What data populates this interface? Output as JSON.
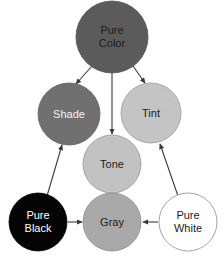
{
  "diagram": {
    "background_color": "#ffffff",
    "arrow_color": "#3a3a3a",
    "nodes": [
      {
        "id": "pure-color",
        "label_line1": "Pure",
        "label_line2": "Color",
        "cx": 112,
        "cy": 37,
        "r": 36,
        "fill": "#5b5b5b",
        "stroke": "#4f4f4f",
        "text_color": "#1c1c1c",
        "two_line": true
      },
      {
        "id": "shade",
        "label_line1": "Shade",
        "label_line2": "",
        "cx": 69,
        "cy": 114,
        "r": 31,
        "fill": "#707070",
        "stroke": "#636363",
        "text_color": "#f2f2f2",
        "two_line": false
      },
      {
        "id": "tint",
        "label_line1": "Tint",
        "label_line2": "",
        "cx": 151,
        "cy": 113,
        "r": 30,
        "fill": "#c4c4c4",
        "stroke": "#9a9a9a",
        "text_color": "#1c1c1c",
        "two_line": false
      },
      {
        "id": "tone",
        "label_line1": "Tone",
        "label_line2": "",
        "cx": 112,
        "cy": 164,
        "r": 29,
        "fill": "#c2c2c2",
        "stroke": "#979797",
        "text_color": "#1c1c1c",
        "two_line": false
      },
      {
        "id": "pure-black",
        "label_line1": "Pure",
        "label_line2": "Black",
        "cx": 38,
        "cy": 222,
        "r": 29,
        "fill": "#050505",
        "stroke": "#050505",
        "text_color": "#ffffff",
        "two_line": true
      },
      {
        "id": "gray",
        "label_line1": "Gray",
        "label_line2": "",
        "cx": 112,
        "cy": 222,
        "r": 29,
        "fill": "#a9a9a9",
        "stroke": "#8a8a8a",
        "text_color": "#1c1c1c",
        "two_line": false
      },
      {
        "id": "pure-white",
        "label_line1": "Pure",
        "label_line2": "White",
        "cx": 188,
        "cy": 222,
        "r": 29,
        "fill": "#ffffff",
        "stroke": "#8d8d8d",
        "text_color": "#1c1c1c",
        "two_line": true
      }
    ],
    "edges": [
      {
        "id": "pure-color-to-shade",
        "from": "pure-color",
        "to": "shade",
        "x1": 92,
        "y1": 66,
        "x2": 76,
        "y2": 84
      },
      {
        "id": "pure-color-to-tone",
        "from": "pure-color",
        "to": "tone",
        "x1": 112,
        "y1": 73,
        "x2": 112,
        "y2": 134
      },
      {
        "id": "pure-color-to-tint",
        "from": "pure-color",
        "to": "tint",
        "x1": 133,
        "y1": 66,
        "x2": 145,
        "y2": 83
      },
      {
        "id": "pure-black-to-shade",
        "from": "pure-black",
        "to": "shade",
        "x1": 47,
        "y1": 196,
        "x2": 62,
        "y2": 145
      },
      {
        "id": "pure-black-to-gray",
        "from": "pure-black",
        "to": "gray",
        "x1": 68,
        "y1": 222,
        "x2": 82,
        "y2": 222
      },
      {
        "id": "pure-white-to-gray",
        "from": "pure-white",
        "to": "gray",
        "x1": 158,
        "y1": 222,
        "x2": 143,
        "y2": 222
      },
      {
        "id": "pure-white-to-tint",
        "from": "pure-white",
        "to": "tint",
        "x1": 178,
        "y1": 196,
        "x2": 160,
        "y2": 144
      },
      {
        "id": "gray-to-tone",
        "from": "gray",
        "to": "tone",
        "x1": 112,
        "y1": 193,
        "x2": 112,
        "y2": 184
      }
    ]
  }
}
